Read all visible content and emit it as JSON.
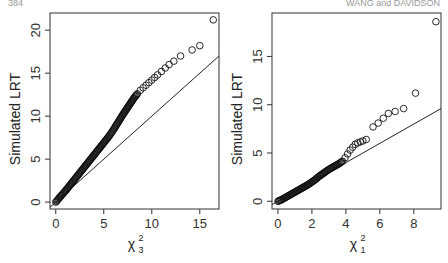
{
  "header": {
    "left": "384",
    "right": "WANG and DAVIDSON"
  },
  "chart_data": [
    {
      "type": "scatter",
      "title": "",
      "xlabel": "χ²₃",
      "xlabel_base": "χ",
      "xlabel_sup": "2",
      "xlabel_sub": "3",
      "ylabel": "Simulated LRT",
      "xlim": [
        -0.6,
        17
      ],
      "ylim": [
        -0.8,
        22
      ],
      "xticks": [
        0,
        5,
        10,
        15
      ],
      "yticks": [
        0,
        5,
        10,
        15,
        20
      ],
      "grid": false,
      "reference_line": {
        "slope": 1,
        "intercept": 0
      },
      "series": [
        {
          "name": "QQ points",
          "x": [
            0,
            0.3,
            0.6,
            1,
            1.5,
            2,
            2.5,
            3,
            3.5,
            4,
            4.5,
            5,
            5.5,
            6,
            6.5,
            7,
            7.3,
            7.6,
            7.9,
            8.2,
            8.5,
            8.8,
            9.1,
            9.4,
            9.7,
            10,
            10.3,
            10.6,
            11,
            11.4,
            11.8,
            12.3,
            13,
            14.2,
            15,
            16.4
          ],
          "y": [
            0,
            0.4,
            0.8,
            1.3,
            2,
            2.7,
            3.4,
            4.1,
            4.8,
            5.5,
            6.2,
            6.9,
            7.6,
            8.4,
            9.3,
            10.2,
            10.7,
            11.2,
            11.7,
            12.2,
            12.6,
            13,
            13.3,
            13.6,
            13.9,
            14.2,
            14.5,
            14.8,
            15.2,
            15.6,
            16,
            16.4,
            17,
            17.7,
            18.2,
            21.2
          ]
        }
      ]
    },
    {
      "type": "scatter",
      "title": "",
      "xlabel": "χ²₁",
      "xlabel_base": "χ",
      "xlabel_sup": "2",
      "xlabel_sub": "1",
      "ylabel": "Simulated LRT",
      "xlim": [
        -0.35,
        9.6
      ],
      "ylim": [
        -0.8,
        19.5
      ],
      "xticks": [
        0,
        2,
        4,
        6,
        8
      ],
      "yticks": [
        0,
        5,
        10,
        15
      ],
      "grid": false,
      "reference_line": {
        "slope": 1,
        "intercept": 0
      },
      "series": [
        {
          "name": "QQ points",
          "x": [
            0,
            0.2,
            0.4,
            0.6,
            0.8,
            1,
            1.2,
            1.4,
            1.6,
            1.8,
            2,
            2.2,
            2.4,
            2.6,
            2.8,
            3,
            3.2,
            3.4,
            3.6,
            3.8,
            3.95,
            4.1,
            4.25,
            4.4,
            4.55,
            4.7,
            4.85,
            5,
            5.2,
            5.6,
            5.9,
            6.2,
            6.5,
            6.9,
            7.4,
            8.1,
            9.3
          ],
          "y": [
            0,
            0.15,
            0.35,
            0.55,
            0.75,
            0.95,
            1.15,
            1.35,
            1.55,
            1.75,
            2,
            2.25,
            2.55,
            2.8,
            3.05,
            3.3,
            3.5,
            3.7,
            3.9,
            4.15,
            4.5,
            4.9,
            5.3,
            5.6,
            5.9,
            6.05,
            6.15,
            6.25,
            6.4,
            7.7,
            8.1,
            8.6,
            9.1,
            9.3,
            9.6,
            11.2,
            18.6
          ]
        }
      ]
    }
  ]
}
